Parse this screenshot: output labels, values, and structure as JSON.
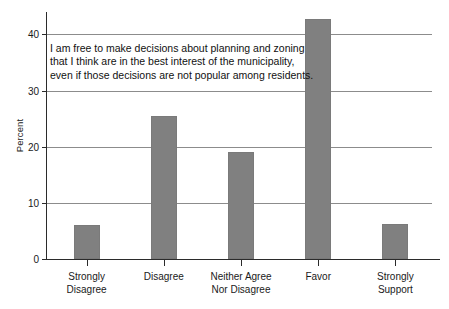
{
  "chart_data": {
    "type": "bar",
    "title": "",
    "annotation": [
      "I am free to make decisions about planning and zoning",
      "that I think are in the best interest of the municipality,",
      "even if those decisions are not popular among residents."
    ],
    "categories": [
      "Strongly\nDisagree",
      "Disagree",
      "Neither Agree\nNor Disagree",
      "Favor",
      "Strongly\nSupport"
    ],
    "category_lines": [
      [
        "Strongly",
        "Disagree"
      ],
      [
        "Disagree",
        ""
      ],
      [
        "Neither Agree",
        "Nor Disagree"
      ],
      [
        "Favor",
        ""
      ],
      [
        "Strongly",
        "Support"
      ]
    ],
    "values": [
      6.0,
      25.4,
      19.0,
      42.7,
      6.2
    ],
    "xlabel": "",
    "ylabel": "Percent",
    "ylim": [
      0,
      44
    ],
    "yticks": [
      0,
      10,
      20,
      30,
      40
    ],
    "ytick_labels": [
      "0",
      "10",
      "20",
      "30",
      "40"
    ],
    "grid": true,
    "legend": "none",
    "bar_color": "#808080",
    "axis_color": "#2b2b2b",
    "grid_color": "#8c8c8c",
    "background": "#ffffff"
  }
}
